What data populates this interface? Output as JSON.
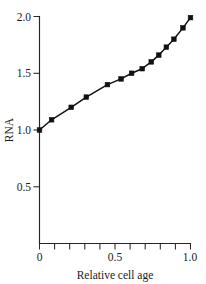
{
  "chart_data": {
    "type": "line",
    "title": "",
    "subtitle": "",
    "xlabel": "Relative cell age",
    "ylabel": "RNA",
    "xlim": [
      0,
      1.0
    ],
    "ylim": [
      0,
      2.0
    ],
    "grid": false,
    "legend": false,
    "legend_position": "none",
    "marker": "square",
    "line_color": "#111111",
    "marker_color": "#111111",
    "axis_color": "#262626",
    "background": "#ffffff",
    "x_tick_labels": [
      "0",
      "0.5",
      "1.0"
    ],
    "x_tick_values": [
      0,
      0.5,
      1.0
    ],
    "x_minor_tick_values": [
      0.0,
      0.1,
      0.2,
      0.3,
      0.4,
      0.5,
      0.6,
      0.7,
      0.8,
      0.9,
      1.0
    ],
    "y_tick_labels": [
      "0",
      "0.5",
      "1.0",
      "1.5",
      "2.0"
    ],
    "y_tick_values": [
      0,
      0.5,
      1.0,
      1.5,
      2.0
    ],
    "y_labeled_ticks": [
      0.5,
      1.0,
      1.5,
      2.0
    ],
    "series": [
      {
        "name": "RNA",
        "x": [
          0.0,
          0.08,
          0.21,
          0.31,
          0.45,
          0.54,
          0.61,
          0.68,
          0.74,
          0.79,
          0.84,
          0.89,
          0.95,
          1.0
        ],
        "y": [
          1.0,
          1.09,
          1.2,
          1.29,
          1.4,
          1.45,
          1.5,
          1.54,
          1.6,
          1.66,
          1.73,
          1.8,
          1.9,
          1.99
        ]
      }
    ]
  },
  "figure": {
    "caption": ""
  }
}
